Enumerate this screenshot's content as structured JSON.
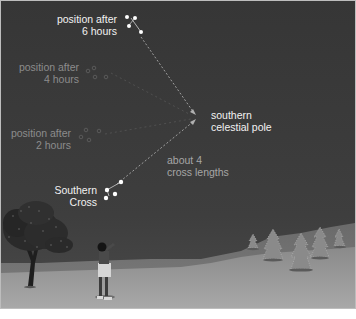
{
  "diagram": {
    "labels": {
      "pos6_line1": "position after",
      "pos6_line2": "6 hours",
      "pos4_line1": "position after",
      "pos4_line2": "4 hours",
      "pos2_line1": "position after",
      "pos2_line2": "2 hours",
      "pole_line1": "southern",
      "pole_line2": "celestial pole",
      "dist_line1": "about 4",
      "dist_line2": "cross lengths",
      "cross_line1": "Southern",
      "cross_line2": "Cross"
    },
    "colors": {
      "sky": "#3a3a3a",
      "ground": "#9a9a9a",
      "hill": "#7e7e7e",
      "star": "#ffffff",
      "label_bright": "#f2f2f2",
      "label_dim": "#8c8c8c",
      "arrow": "#b0b0b0",
      "border": "#bdbdbd"
    },
    "positions": [
      {
        "name": "Southern Cross (now)",
        "x": 108,
        "y": 191
      },
      {
        "name": "after 2 hours",
        "x": 88,
        "y": 133
      },
      {
        "name": "after 4 hours",
        "x": 96,
        "y": 72
      },
      {
        "name": "after 6 hours",
        "x": 132,
        "y": 22
      }
    ],
    "pole": {
      "x": 196,
      "y": 116
    }
  }
}
